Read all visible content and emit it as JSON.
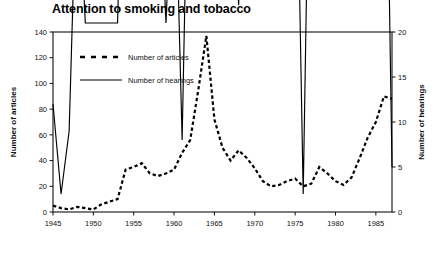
{
  "chart_data": {
    "type": "line",
    "title": "Attention to smoking and tobacco",
    "xlabel": "",
    "grid": false,
    "legend_position": "top-left-inside",
    "x": [
      1945,
      1946,
      1947,
      1948,
      1949,
      1950,
      1951,
      1952,
      1953,
      1954,
      1955,
      1956,
      1957,
      1958,
      1959,
      1960,
      1961,
      1962,
      1963,
      1964,
      1965,
      1966,
      1967,
      1968,
      1969,
      1970,
      1971,
      1972,
      1973,
      1974,
      1975,
      1976,
      1977,
      1978,
      1979,
      1980,
      1981,
      1982,
      1983,
      1984,
      1985,
      1986,
      1987
    ],
    "xlim": [
      1945,
      1987
    ],
    "xticks": [
      1945,
      1950,
      1955,
      1960,
      1965,
      1970,
      1975,
      1980,
      1985
    ],
    "xticklabels": [
      "1945",
      "1950",
      "1955",
      "1960",
      "1965",
      "1970",
      "1975",
      "1980",
      "1985"
    ],
    "axes": [
      {
        "side": "left",
        "ylabel": "Number of articles",
        "ylim": [
          0,
          140
        ],
        "yticks": [
          0,
          20,
          40,
          60,
          80,
          100,
          120,
          140
        ],
        "yticklabels": [
          "0",
          "20",
          "40",
          "60",
          "80",
          "100",
          "120",
          "140"
        ]
      },
      {
        "side": "right",
        "ylabel": "Number of hearings",
        "ylim": [
          0,
          20
        ],
        "yticks": [
          0,
          5,
          10,
          15,
          20
        ],
        "yticklabels": [
          "0",
          "5",
          "10",
          "15",
          "20"
        ]
      }
    ],
    "series": [
      {
        "name": "Number of articles",
        "axis": "left",
        "style": "dashed",
        "color": "#000000",
        "values": [
          5,
          3,
          2,
          4,
          3,
          2,
          6,
          8,
          10,
          33,
          35,
          38,
          30,
          28,
          30,
          33,
          46,
          56,
          95,
          137,
          72,
          50,
          40,
          48,
          42,
          34,
          24,
          20,
          21,
          24,
          26,
          20,
          22,
          35,
          30,
          24,
          21,
          27,
          42,
          58,
          70,
          90,
          88
        ]
      },
      {
        "name": "Number of hearings",
        "axis": "right",
        "style": "solid",
        "color": "#000000",
        "values": [
          12,
          2,
          9,
          40,
          21,
          21,
          21,
          21,
          21,
          57,
          35,
          64,
          45,
          40,
          21,
          43,
          8,
          54,
          28,
          67,
          28,
          40,
          42,
          23,
          57,
          52,
          38,
          52,
          52,
          38,
          52,
          2,
          57,
          118,
          82,
          64,
          85,
          108,
          66,
          54,
          118,
          63,
          5
        ]
      }
    ],
    "annotations": []
  },
  "legend": {
    "items": [
      {
        "label": "Number of articles",
        "style": "dashed"
      },
      {
        "label": "Number of hearings",
        "style": "solid"
      }
    ]
  }
}
